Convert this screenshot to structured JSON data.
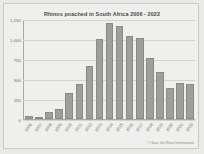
{
  "chart_data": {
    "type": "bar",
    "title": "Rhinos poached in South Africa 2006 - 2022",
    "xlabel": "",
    "ylabel": "",
    "categories": [
      "2006",
      "2007",
      "2008",
      "2009",
      "2010",
      "2011",
      "2012",
      "2013",
      "2014",
      "2015",
      "2016",
      "2017",
      "2018",
      "2019",
      "2020",
      "2021",
      "2022"
    ],
    "values": [
      36,
      13,
      83,
      122,
      333,
      448,
      668,
      1004,
      1215,
      1175,
      1054,
      1028,
      769,
      594,
      394,
      451,
      448
    ],
    "ylim": [
      0,
      1250
    ],
    "yticks": [
      "0",
      "250",
      "500",
      "750",
      "1,000",
      "1,250"
    ],
    "ytick_values": [
      0,
      250,
      500,
      750,
      1000,
      1250
    ],
    "grid": true,
    "legend": "none",
    "bar_color": "#9e9e9b"
  },
  "credit": "© Save the Rhino International"
}
